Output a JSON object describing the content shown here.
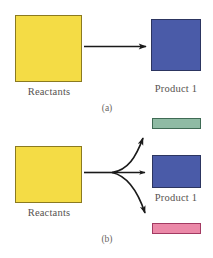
{
  "figure": {
    "background_color": "#ffffff",
    "panels": [
      {
        "id": "a",
        "panel_label": "(a)",
        "reactant": {
          "label": "Reactants",
          "fill": "#f4dc45",
          "stroke": "#8b7a20",
          "x": 15,
          "y": 15,
          "w": 67,
          "h": 67
        },
        "products": [
          {
            "label": "Product 1",
            "fill": "#4a5ba8",
            "stroke": "#2c3560",
            "x": 151,
            "y": 19,
            "w": 50,
            "h": 52
          }
        ],
        "arrows": [
          {
            "kind": "straight",
            "from_x": 84,
            "from_y": 46,
            "to_x": 149,
            "to_y": 46
          }
        ]
      },
      {
        "id": "b",
        "panel_label": "(b)",
        "reactant": {
          "label": "Reactants",
          "fill": "#f4dc45",
          "stroke": "#8b7a20",
          "x": 15,
          "y": 146,
          "w": 67,
          "h": 57
        },
        "products": [
          {
            "label": "",
            "fill": "#8fbba4",
            "stroke": "#3f6b54",
            "x": 152,
            "y": 118,
            "w": 49,
            "h": 11
          },
          {
            "label": "Product 1",
            "fill": "#4a5ba8",
            "stroke": "#2c3560",
            "x": 152,
            "y": 155,
            "w": 49,
            "h": 33
          },
          {
            "label": "",
            "fill": "#eb89a8",
            "stroke": "#a33a62",
            "x": 152,
            "y": 223,
            "w": 49,
            "h": 11
          }
        ],
        "arrows": [
          {
            "kind": "straight",
            "from_x": 84,
            "from_y": 172,
            "to_x": 111,
            "to_y": 172
          },
          {
            "kind": "curved-up",
            "from_x": 111,
            "from_y": 172,
            "to_x": 150,
            "to_y": 130
          },
          {
            "kind": "straight",
            "from_x": 111,
            "from_y": 172,
            "to_x": 149,
            "to_y": 172
          },
          {
            "kind": "curved-down",
            "from_x": 111,
            "from_y": 172,
            "to_x": 150,
            "to_y": 221
          }
        ]
      }
    ],
    "text": {
      "reactants_a": "Reactants",
      "product1_a": "Product 1",
      "panel_a": "(a)",
      "reactants_b": "Reactants",
      "product1_b": "Product 1",
      "panel_b": "(b)"
    },
    "colors": {
      "yellow_fill": "#f4dc45",
      "yellow_stroke": "#8b7a20",
      "blue_fill": "#4a5ba8",
      "blue_stroke": "#2c3560",
      "green_fill": "#8fbba4",
      "green_stroke": "#3f6b54",
      "pink_fill": "#eb89a8",
      "pink_stroke": "#a33a62",
      "arrow_color": "#1a1a1a",
      "text_color": "#57524f"
    }
  }
}
